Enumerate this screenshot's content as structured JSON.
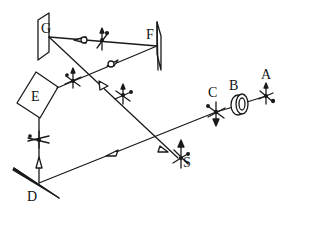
{
  "diagram": {
    "stroke_color": "#1a1a1a",
    "background": "#ffffff",
    "labels": {
      "A": "A",
      "B": "B",
      "C": "C",
      "D": "D",
      "E": "E",
      "F": "F",
      "G": "G",
      "S": "S"
    },
    "components": [
      {
        "id": "A",
        "type": "source-point"
      },
      {
        "id": "B",
        "type": "disk-polarizer"
      },
      {
        "id": "C",
        "type": "polarization-point"
      },
      {
        "id": "D",
        "type": "plane-mirror"
      },
      {
        "id": "E",
        "type": "square-prism"
      },
      {
        "id": "F",
        "type": "plane-mirror"
      },
      {
        "id": "G",
        "type": "plane-mirror"
      },
      {
        "id": "S",
        "type": "screen-point"
      }
    ],
    "beam_path": [
      "A",
      "B",
      "C",
      "D",
      "E",
      "F",
      "G",
      "S"
    ]
  }
}
